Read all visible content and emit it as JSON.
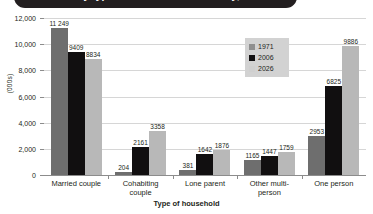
{
  "title": "Households by type of household and family, Great Britain",
  "chart_data": {
    "type": "bar",
    "title": "Households by type of household and family, Great Britain",
    "xlabel": "Type of household",
    "ylabel": "(000s)",
    "ylim": [
      0,
      12000
    ],
    "yticks": [
      "0",
      "2,000",
      "4,000",
      "6,000",
      "8,000",
      "10,000",
      "12,000"
    ],
    "ytick_values": [
      0,
      2000,
      4000,
      6000,
      8000,
      10000,
      12000
    ],
    "grid": true,
    "legend_position": "inside-upper-right",
    "categories": [
      "Married couple",
      "Cohabiting couple",
      "Lone parent",
      "Other multi-person",
      "One person"
    ],
    "category_lines": [
      [
        "Married couple"
      ],
      [
        "Cohabiting",
        "couple"
      ],
      [
        "Lone parent"
      ],
      [
        "Other multi-",
        "person"
      ],
      [
        "One person"
      ]
    ],
    "series": [
      {
        "name": "1971",
        "color": "#6e6e6e",
        "values": [
          11249,
          204,
          381,
          1165,
          2953
        ],
        "labels": [
          "11 249",
          "204",
          "381",
          "1165",
          "2953"
        ]
      },
      {
        "name": "2006",
        "color": "#110f10",
        "values": [
          9409,
          2161,
          1642,
          1447,
          6825
        ],
        "labels": [
          "9409",
          "2161",
          "1642",
          "1447",
          "6825"
        ]
      },
      {
        "name": "2026",
        "color": "#b8b8b8",
        "values": [
          8834,
          3358,
          1876,
          1759,
          9886
        ],
        "labels": [
          "8834",
          "3358",
          "1876",
          "1759",
          "9886"
        ]
      }
    ]
  }
}
